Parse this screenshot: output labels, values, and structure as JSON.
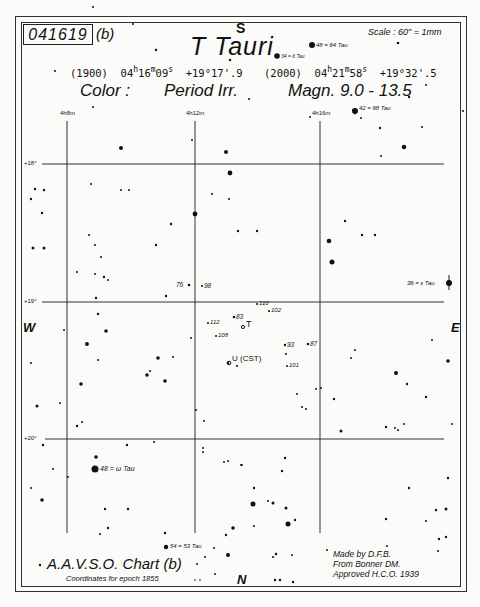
{
  "chart_id": "041619",
  "chart_variant": "(b)",
  "title": "T Tauri",
  "scale": "Scale : 60\" = 1mm",
  "coords_1900": {
    "epoch": "(1900)",
    "ra": "04h16m09s",
    "ra_h": "04",
    "ra_m": "16",
    "ra_s": "09",
    "dec": "+19°17'.9"
  },
  "coords_2000": {
    "epoch": "(2000)",
    "ra": "04h21m58s",
    "ra_h": "04",
    "ra_m": "21",
    "ra_s": "58",
    "dec": "+19°32'.5"
  },
  "color_label": "Color :",
  "period_label": "Period Irr.",
  "magnitude_label": "Magn. 9.0 - 13.5",
  "directions": {
    "top": "S",
    "bottom": "N",
    "left": "W",
    "right": "E"
  },
  "ra_grid": [
    "4h8m",
    "4h12m",
    "4h16m"
  ],
  "dec_grid": [
    "+18°",
    "+19°",
    "+20°"
  ],
  "named_stars": [
    {
      "label": "48 = 64 Tau"
    },
    {
      "label": "34 = δ Tau"
    },
    {
      "label": "42 = 68 Tau"
    },
    {
      "label": "36 = ε Tau"
    },
    {
      "label": "48 = ω Tau"
    },
    {
      "label": "54 = 53 Tau"
    }
  ],
  "comparison_stars": [
    "76",
    "98",
    "110",
    "102",
    "83",
    "112",
    "108",
    "93",
    "87",
    "101"
  ],
  "variables": [
    {
      "label": "T"
    },
    {
      "label": "U (CST)"
    }
  ],
  "footer": {
    "chart_name": "A.A.V.S.O. Chart (b)",
    "epoch_note": "Coordinates for epoch 1855",
    "credits": [
      "Made by D.F.B.",
      "From Bonner DM.",
      "Approved H.C.O. 1939"
    ]
  }
}
